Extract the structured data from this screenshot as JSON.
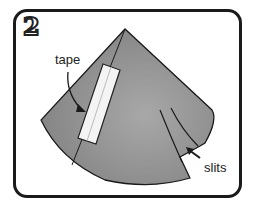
{
  "step_number": "2",
  "labels": {
    "tape": "tape",
    "slits": "slits"
  },
  "colors": {
    "frame": "#1a1a1a",
    "cone_fill": "#8f8f8f",
    "tape_fill": "#f2f2f2",
    "background": "#ffffff"
  },
  "icons": {
    "arrow_tape": "curved-arrow-icon",
    "arrow_slits": "arrow-icon"
  }
}
